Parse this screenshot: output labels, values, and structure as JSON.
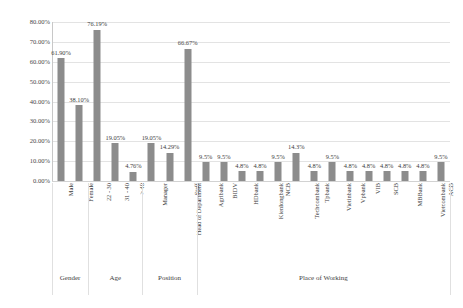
{
  "chart_data": {
    "type": "bar",
    "title": "",
    "subtitle": "",
    "xlabel": "",
    "ylabel": "",
    "ylim": [
      0,
      80
    ],
    "grid": true,
    "legend": false,
    "legend_position": "none",
    "y_ticks": [
      "0.00%",
      "10.00%",
      "20.00%",
      "30.00%",
      "40.00%",
      "50.00%",
      "60.00%",
      "70.00%",
      "80.00%"
    ],
    "y_tick_values": [
      0,
      10,
      20,
      30,
      40,
      50,
      60,
      70,
      80
    ],
    "bar_color": "#8c8c8c",
    "categories": [
      "Male",
      "Female",
      "22 - 30",
      "31 - 40",
      "> 40",
      "Manager",
      "Head of Department",
      "Staff",
      "Agribank",
      "BIDV",
      "HDbank",
      "Kienlongbank",
      "NCB",
      "Techcombank",
      "Tpbank",
      "Vietinbank",
      "Vpbank",
      "VIB",
      "SCB",
      "MBBank",
      "Vietcombank",
      "ACB"
    ],
    "values": [
      61.9,
      38.1,
      76.19,
      19.05,
      4.76,
      19.05,
      14.29,
      66.67,
      9.5,
      9.5,
      4.8,
      4.8,
      9.5,
      14.3,
      4.8,
      9.5,
      4.8,
      4.8,
      4.8,
      4.8,
      4.8,
      9.5
    ],
    "data_labels": [
      "61.90%",
      "38.10%",
      "76.19%",
      "19.05%",
      "4.76%",
      "19.05%",
      "14.29%",
      "66.67%",
      "9.5%",
      "9.5%",
      "4.8%",
      "4.8%",
      "9.5%",
      "14.3%",
      "4.8%",
      "9.5%",
      "4.8%",
      "4.8%",
      "4.8%",
      "4.8%",
      "4.8%",
      "9.5%"
    ],
    "groups": [
      {
        "name": "Gender",
        "start": 0,
        "count": 2
      },
      {
        "name": "Age",
        "start": 2,
        "count": 3
      },
      {
        "name": "Position",
        "start": 5,
        "count": 3
      },
      {
        "name": "Place of Working",
        "start": 8,
        "count": 14
      }
    ]
  }
}
